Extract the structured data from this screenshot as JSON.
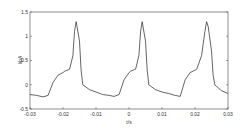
{
  "chart_data": {
    "type": "line",
    "title": "",
    "xlabel": "t/s",
    "ylabel": "I/pA",
    "xlim": [
      -0.03,
      0.03
    ],
    "ylim": [
      -0.5,
      1.5
    ],
    "xticks": [
      "-0.03",
      "-0.02",
      "-0.01",
      "0",
      "0.01",
      "0.02",
      "0.03"
    ],
    "yticks": [
      "-0.5",
      "0",
      "0.5",
      "1",
      "1.5"
    ],
    "grid": false,
    "legend": null,
    "series": [
      {
        "name": "current",
        "x": [
          -0.03,
          -0.028,
          -0.026,
          -0.0245,
          -0.023,
          -0.0215,
          -0.02,
          -0.0195,
          -0.018,
          -0.017,
          -0.0165,
          -0.016,
          -0.015,
          -0.0145,
          -0.014,
          -0.012,
          -0.01,
          -0.008,
          -0.006,
          -0.0045,
          -0.003,
          -0.0015,
          0,
          0.0005,
          0.002,
          0.003,
          0.0035,
          0.004,
          0.005,
          0.0055,
          0.006,
          0.008,
          0.01,
          0.012,
          0.014,
          0.0155,
          0.017,
          0.0185,
          0.02,
          0.0205,
          0.022,
          0.023,
          0.0235,
          0.024,
          0.025,
          0.0255,
          0.026,
          0.028,
          0.03
        ],
        "y": [
          -0.2,
          -0.22,
          -0.25,
          -0.22,
          0.05,
          0.2,
          0.25,
          0.28,
          0.32,
          0.6,
          1.1,
          1.3,
          0.9,
          0.3,
          0.0,
          -0.1,
          -0.15,
          -0.2,
          -0.22,
          -0.24,
          -0.2,
          0.1,
          0.25,
          0.28,
          0.32,
          0.6,
          1.1,
          1.3,
          0.9,
          0.3,
          0.0,
          -0.1,
          -0.15,
          -0.18,
          -0.22,
          -0.24,
          0.1,
          0.25,
          0.3,
          0.32,
          0.6,
          1.1,
          1.3,
          1.2,
          0.7,
          0.2,
          0.0,
          -0.12,
          -0.18
        ]
      }
    ]
  }
}
